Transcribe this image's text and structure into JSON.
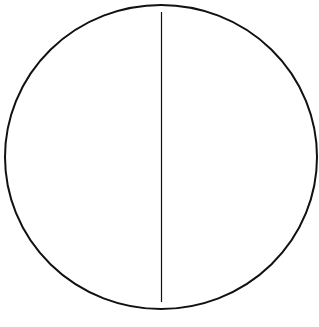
{
  "diagram": {
    "colors": {
      "stroke": "#111111",
      "background": "#ffffff"
    },
    "circle": {
      "cx": 161,
      "cy": 157,
      "rx": 156,
      "ry": 152,
      "stroke_width": 2
    },
    "line": {
      "x1": 161.5,
      "y1": 12,
      "x2": 161.5,
      "y2": 302,
      "stroke_width": 1.2
    }
  }
}
